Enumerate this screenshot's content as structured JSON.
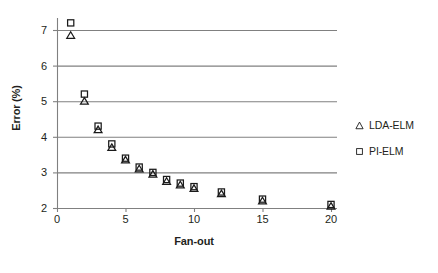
{
  "chart_data": {
    "type": "scatter",
    "title": "",
    "xlabel": "Fan-out",
    "ylabel": "Error (%)",
    "xlim": [
      0,
      20
    ],
    "ylim": [
      2,
      7.5
    ],
    "xticks": [
      0,
      5,
      10,
      15,
      20
    ],
    "yticks": [
      2,
      3,
      4,
      5,
      6,
      7
    ],
    "grid": "horizontal",
    "legend_position": "right",
    "x": [
      1,
      2,
      3,
      4,
      5,
      6,
      7,
      8,
      9,
      10,
      12,
      15,
      20
    ],
    "series": [
      {
        "name": "LDA-ELM",
        "marker": "triangle",
        "values": [
          6.85,
          5.0,
          4.2,
          3.7,
          3.35,
          3.1,
          2.95,
          2.75,
          2.65,
          2.55,
          2.4,
          2.2,
          2.05
        ]
      },
      {
        "name": "PI-ELM",
        "marker": "square",
        "values": [
          7.2,
          5.2,
          4.3,
          3.8,
          3.4,
          3.15,
          3.0,
          2.8,
          2.7,
          2.6,
          2.45,
          2.25,
          2.1
        ]
      }
    ],
    "colors": {
      "marker": "#1a1a1a",
      "grid": "#808080",
      "axis": "#808080",
      "text": "#231f20",
      "background": "#ffffff"
    }
  },
  "legend": {
    "items": [
      {
        "label": "LDA-ELM",
        "marker": "triangle"
      },
      {
        "label": "PI-ELM",
        "marker": "square"
      }
    ]
  },
  "axis": {
    "y_label": "Error (%)",
    "x_label": "Fan-out",
    "y_tick_labels": [
      "7",
      "6",
      "5",
      "4",
      "3",
      "2"
    ],
    "x_tick_labels": [
      "0",
      "5",
      "10",
      "15",
      "20"
    ]
  }
}
